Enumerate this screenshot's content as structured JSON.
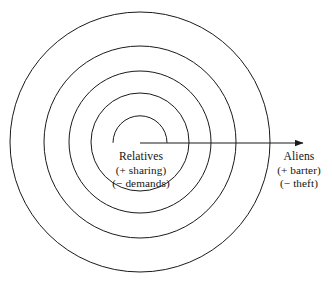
{
  "figure": {
    "type": "concentric-circle-diagram",
    "background_color": "#ffffff",
    "stroke_color": "#1a1a1a",
    "width": 332,
    "height": 290
  },
  "diagram": {
    "center": {
      "x": 140,
      "y": 142
    },
    "circles": [
      {
        "name": "ring-1-innermost",
        "radius": 27,
        "open_arc": true,
        "arc_start_deg": 180,
        "arc_end_deg": 0
      },
      {
        "name": "ring-2",
        "radius": 49,
        "open_arc": false
      },
      {
        "name": "ring-3",
        "radius": 71,
        "open_arc": false
      },
      {
        "name": "ring-4",
        "radius": 96,
        "open_arc": false
      },
      {
        "name": "ring-5-outermost",
        "radius": 130,
        "open_arc": false
      }
    ],
    "arrow": {
      "name": "outward-arrow",
      "x1": 140,
      "y1": 143,
      "x2": 307,
      "y2": 143,
      "head": "solid-triangle"
    }
  },
  "labels": {
    "inner": {
      "name": "Relatives",
      "positive": "(+ sharing)",
      "negative": "(− demands)"
    },
    "outer": {
      "name": "Aliens",
      "positive": "(+ barter)",
      "negative": "(− theft)"
    }
  }
}
